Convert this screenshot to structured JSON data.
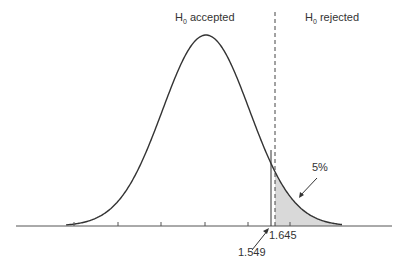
{
  "labels": {
    "accepted_prefix": "H",
    "accepted_sub": "0",
    "accepted_suffix": " accepted",
    "rejected_prefix": "H",
    "rejected_sub": "0",
    "rejected_suffix": " rejected",
    "tail_percent": "5%",
    "critical_value": "1.645",
    "observed_value": "1.549"
  },
  "colors": {
    "curve": "#333333",
    "shade": "#d9d9d9",
    "axis": "#555555"
  }
}
